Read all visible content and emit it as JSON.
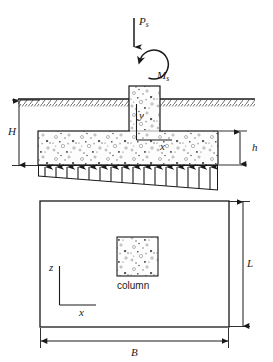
{
  "figure": {
    "elevation": {
      "load_label": "P",
      "load_subscript": "s",
      "moment_label": "M",
      "moment_subscript": "s",
      "depth_label": "H",
      "thickness_label": "h",
      "axis_vertical_label": "y",
      "axis_horizontal_label": "x",
      "ground_hatch": "ground-surface-hatching",
      "pressure_label": ""
    },
    "plan": {
      "column_label": "column",
      "width_label": "B",
      "length_label": "L",
      "axis_vertical_label": "z",
      "axis_horizontal_label": "x"
    },
    "colors": {
      "line": "#1a1a1a",
      "concrete_fill": "#fdfdfd",
      "aggregate": "#6b6b6b",
      "background": "#ffffff"
    }
  }
}
